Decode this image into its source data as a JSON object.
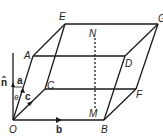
{
  "diagram": {
    "type": "parallelepiped",
    "vertices": {
      "O": "O",
      "A": "A",
      "B": "B",
      "C": "C",
      "D": "D",
      "E": "E",
      "F": "F",
      "G": "G"
    },
    "dashed_line": {
      "top": "N",
      "bottom": "M"
    },
    "vectors": {
      "a": "a",
      "b": "b",
      "c": "c",
      "n": "n̂"
    },
    "angle": "θ",
    "stroke_color": "#1a1a1a"
  }
}
